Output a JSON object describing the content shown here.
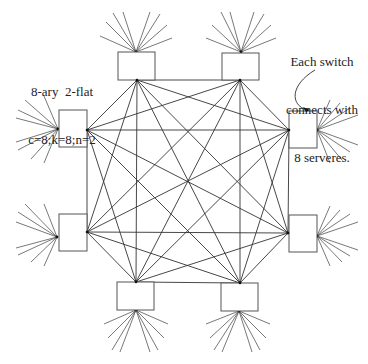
{
  "diagram": {
    "title_lines": [
      "8-ary  2-flat",
      "c=8;k=8;n=2"
    ],
    "note_lines": [
      "Each switch",
      "connects with",
      "8 serveres."
    ],
    "colors": {
      "stroke": "#333333",
      "box_stroke": "#555555",
      "background": "#ffffff"
    },
    "switches": [
      {
        "id": "top-left",
        "x": 118,
        "y": 52,
        "w": 37,
        "h": 28,
        "mesh": [
          137,
          80
        ],
        "fan_origin": [
          136,
          52
        ],
        "fan": [
          [
            113,
            13
          ],
          [
            123,
            12
          ],
          [
            106,
            22
          ],
          [
            100,
            36
          ],
          [
            150,
            12
          ],
          [
            160,
            14
          ],
          [
            167,
            25
          ],
          [
            172,
            38
          ]
        ]
      },
      {
        "id": "top-right",
        "x": 222,
        "y": 53,
        "w": 37,
        "h": 27,
        "mesh": [
          240,
          80
        ],
        "fan_origin": [
          241,
          52
        ],
        "fan": [
          [
            221,
            12
          ],
          [
            230,
            12
          ],
          [
            212,
            25
          ],
          [
            206,
            38
          ],
          [
            254,
            12
          ],
          [
            264,
            14
          ],
          [
            271,
            25
          ],
          [
            276,
            38
          ]
        ]
      },
      {
        "id": "left-upper",
        "x": 59,
        "y": 110,
        "w": 28,
        "h": 37,
        "mesh": [
          87,
          130
        ],
        "fan_origin": [
          58,
          129
        ],
        "fan": [
          [
            25,
            100
          ],
          [
            18,
            110
          ],
          [
            16,
            118
          ],
          [
            44,
            96
          ],
          [
            16,
            142
          ],
          [
            18,
            150
          ],
          [
            31,
            159
          ],
          [
            44,
            163
          ]
        ]
      },
      {
        "id": "right-upper",
        "x": 289,
        "y": 111,
        "w": 28,
        "h": 37,
        "mesh": [
          289,
          130
        ],
        "fan_origin": [
          317,
          130
        ],
        "fan": [
          [
            330,
            100
          ],
          [
            340,
            103
          ],
          [
            350,
            108
          ],
          [
            358,
            115
          ],
          [
            358,
            145
          ],
          [
            350,
            152
          ],
          [
            342,
            160
          ],
          [
            330,
            163
          ]
        ]
      },
      {
        "id": "left-lower",
        "x": 59,
        "y": 214,
        "w": 28,
        "h": 37,
        "mesh": [
          87,
          232
        ],
        "fan_origin": [
          57,
          237
        ],
        "fan": [
          [
            25,
            204
          ],
          [
            18,
            212
          ],
          [
            16,
            222
          ],
          [
            44,
            204
          ],
          [
            16,
            248
          ],
          [
            18,
            255
          ],
          [
            31,
            262
          ],
          [
            44,
            266
          ]
        ]
      },
      {
        "id": "right-lower",
        "x": 289,
        "y": 215,
        "w": 28,
        "h": 37,
        "mesh": [
          288,
          233
        ],
        "fan_origin": [
          317,
          236
        ],
        "fan": [
          [
            330,
            206
          ],
          [
            340,
            210
          ],
          [
            350,
            214
          ],
          [
            358,
            222
          ],
          [
            358,
            250
          ],
          [
            350,
            256
          ],
          [
            342,
            262
          ],
          [
            330,
            266
          ]
        ]
      },
      {
        "id": "bottom-left",
        "x": 117,
        "y": 282,
        "w": 37,
        "h": 28,
        "mesh": [
          136,
          282
        ],
        "fan_origin": [
          136,
          310
        ],
        "fan": [
          [
            104,
            324
          ],
          [
            108,
            338
          ],
          [
            112,
            350
          ],
          [
            120,
            352
          ],
          [
            150,
            352
          ],
          [
            158,
            350
          ],
          [
            164,
            338
          ],
          [
            168,
            324
          ]
        ]
      },
      {
        "id": "bottom-right",
        "x": 221,
        "y": 283,
        "w": 37,
        "h": 28,
        "mesh": [
          240,
          283
        ],
        "fan_origin": [
          239,
          311
        ],
        "fan": [
          [
            206,
            324
          ],
          [
            210,
            338
          ],
          [
            214,
            350
          ],
          [
            222,
            352
          ],
          [
            252,
            352
          ],
          [
            260,
            350
          ],
          [
            266,
            338
          ],
          [
            270,
            324
          ]
        ]
      }
    ],
    "arrow": {
      "path": "M 315 70 C 290 85, 290 105, 307 110",
      "head": [
        307,
        111
      ]
    }
  }
}
